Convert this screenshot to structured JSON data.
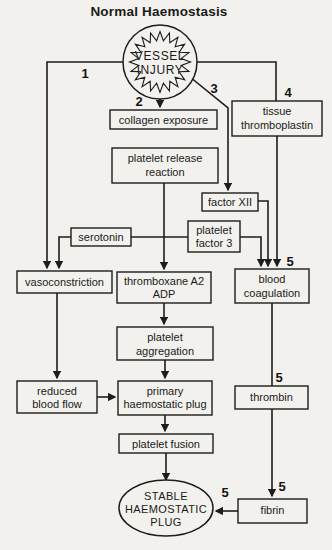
{
  "title": "Normal Haemostasis",
  "colors": {
    "ink": "#1d1d1b",
    "background": "#f2f1ed"
  },
  "diagram": {
    "type": "flowchart",
    "nodes": {
      "vessel_injury": {
        "shape": "starburst-circle",
        "lines": [
          "VESSEL",
          "INJURY"
        ]
      },
      "collagen_exposure": {
        "shape": "rect",
        "lines": [
          "collagen exposure"
        ]
      },
      "tissue_thromboplastin": {
        "shape": "rect",
        "lines": [
          "tissue",
          "thromboplastin"
        ]
      },
      "platelet_release_reaction": {
        "shape": "rect",
        "lines": [
          "platelet release",
          "reaction"
        ]
      },
      "factor_xii": {
        "shape": "rect",
        "lines": [
          "factor XII"
        ]
      },
      "serotonin": {
        "shape": "rect",
        "lines": [
          "serotonin"
        ]
      },
      "platelet_factor_3": {
        "shape": "rect",
        "lines": [
          "platelet",
          "factor 3"
        ]
      },
      "vasoconstriction": {
        "shape": "rect",
        "lines": [
          "vasoconstriction"
        ]
      },
      "thromboxane_a2_adp": {
        "shape": "rect",
        "lines": [
          "thromboxane A2",
          "ADP"
        ]
      },
      "blood_coagulation": {
        "shape": "rect",
        "lines": [
          "blood",
          "coagulation"
        ]
      },
      "platelet_aggregation": {
        "shape": "rect",
        "lines": [
          "platelet",
          "aggregation"
        ]
      },
      "reduced_blood_flow": {
        "shape": "rect",
        "lines": [
          "reduced",
          "blood flow"
        ]
      },
      "primary_haemostatic_plug": {
        "shape": "rect",
        "lines": [
          "primary",
          "haemostatic plug"
        ]
      },
      "thrombin": {
        "shape": "rect",
        "lines": [
          "thrombin"
        ]
      },
      "platelet_fusion": {
        "shape": "rect",
        "lines": [
          "platelet fusion"
        ]
      },
      "fibrin": {
        "shape": "rect",
        "lines": [
          "fibrin"
        ]
      },
      "stable_haemostatic_plug": {
        "shape": "ellipse",
        "lines": [
          "STABLE",
          "HAEMOSTATIC",
          "PLUG"
        ]
      }
    },
    "step_numbers": {
      "n1": "1",
      "n2": "2",
      "n3": "3",
      "n4": "4",
      "n5": "5"
    },
    "edges": [
      {
        "from": "vessel injury",
        "to": "vasoconstriction",
        "label": "1"
      },
      {
        "from": "vessel injury",
        "to": "collagen exposure",
        "label": "2"
      },
      {
        "from": "vessel injury",
        "to": "factor XII",
        "label": "3"
      },
      {
        "from": "vessel injury",
        "to": "tissue thromboplastin",
        "label": "4"
      },
      {
        "from": "collagen exposure",
        "to": "platelet release reaction"
      },
      {
        "from": "platelet release reaction",
        "to": "serotonin"
      },
      {
        "from": "platelet release reaction",
        "to": "platelet factor 3"
      },
      {
        "from": "platelet release reaction",
        "to": "thromboxane A2 ADP"
      },
      {
        "from": "serotonin",
        "to": "vasoconstriction"
      },
      {
        "from": "platelet factor 3",
        "to": "blood coagulation"
      },
      {
        "from": "factor XII",
        "to": "blood coagulation"
      },
      {
        "from": "tissue thromboplastin",
        "to": "blood coagulation",
        "label": "5"
      },
      {
        "from": "vasoconstriction",
        "to": "reduced blood flow"
      },
      {
        "from": "thromboxane A2 ADP",
        "to": "platelet aggregation"
      },
      {
        "from": "platelet aggregation",
        "to": "primary haemostatic plug"
      },
      {
        "from": "reduced blood flow",
        "to": "primary haemostatic plug"
      },
      {
        "from": "blood coagulation",
        "to": "thrombin",
        "label": "5"
      },
      {
        "from": "primary haemostatic plug",
        "to": "platelet fusion"
      },
      {
        "from": "thrombin",
        "to": "fibrin",
        "label": "5"
      },
      {
        "from": "platelet fusion",
        "to": "stable haemostatic plug"
      },
      {
        "from": "fibrin",
        "to": "stable haemostatic plug",
        "label": "5"
      }
    ]
  }
}
